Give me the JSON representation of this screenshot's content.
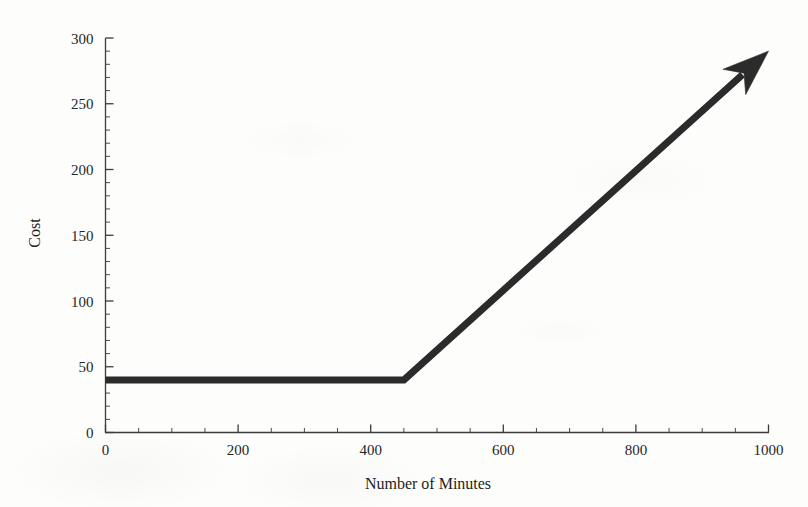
{
  "chart_data": {
    "type": "line",
    "title": "",
    "xlabel": "Number of Minutes",
    "ylabel": "Cost",
    "xlim": [
      0,
      1000
    ],
    "ylim": [
      0,
      300
    ],
    "grid": false,
    "legend": null,
    "x_ticks": [
      0,
      200,
      400,
      600,
      800,
      1000
    ],
    "x_tick_labels": [
      "0",
      "200",
      "400",
      "600",
      "800",
      "1000"
    ],
    "x_minor_tick_step": 50,
    "y_ticks": [
      0,
      50,
      100,
      150,
      200,
      250,
      300
    ],
    "y_tick_labels": [
      "0",
      "50",
      "100",
      "150",
      "200",
      "250",
      "300"
    ],
    "y_minor_tick_step": 10,
    "series": [
      {
        "name": "Cost",
        "style": "piecewise-linear-with-arrow",
        "color": "#2b2b2b",
        "line_width": 7,
        "arrow_at_end": true,
        "points": [
          {
            "x": 0,
            "y": 40
          },
          {
            "x": 450,
            "y": 40
          },
          {
            "x": 1000,
            "y": 290
          }
        ],
        "description": "Flat rate of 40 for the first 450 minutes, then rising linearly at about 0.455 per minute to roughly 290 at 1000 minutes."
      }
    ],
    "annotations": [
      {
        "name": "kink-point",
        "x": 450,
        "y": 40,
        "label": ""
      },
      {
        "name": "arrow-tip",
        "x": 1000,
        "y": 290,
        "label": ""
      }
    ]
  },
  "axes": {
    "y_axis_title": "Cost",
    "x_axis_title": "Number of Minutes"
  },
  "colors": {
    "background": "#fdfdfc",
    "axis": "#3b3b3b",
    "data": "#2b2b2b",
    "text": "#262626"
  }
}
